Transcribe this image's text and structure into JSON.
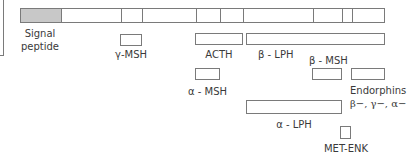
{
  "diagram": {
    "colors": {
      "line": "#7a7a7a",
      "signal_fill": "#c8c8c8",
      "text": "#3a3a3a"
    },
    "main_bar": {
      "segments": [
        {
          "name": "signal-peptide",
          "x0": 20,
          "x1": 60,
          "filled": true
        },
        {
          "name": "n-terminal",
          "x0": 60,
          "x1": 120
        },
        {
          "name": "gamma-msh",
          "x0": 120,
          "x1": 141
        },
        {
          "name": "joining",
          "x0": 141,
          "x1": 195
        },
        {
          "name": "alpha-msh",
          "x0": 195,
          "x1": 219
        },
        {
          "name": "clip",
          "x0": 219,
          "x1": 242
        },
        {
          "name": "gamma-lph-part",
          "x0": 242,
          "x1": 312
        },
        {
          "name": "beta-msh",
          "x0": 312,
          "x1": 341
        },
        {
          "name": "met-enk",
          "x0": 341,
          "x1": 351
        },
        {
          "name": "endorphin",
          "x0": 351,
          "x1": 384
        }
      ]
    },
    "labels": {
      "signal_line1": "Signal",
      "signal_line2": "peptide",
      "gamma_msh": "γ-MSH",
      "acth": "ACTH",
      "beta_lph": "β - LPH",
      "alpha_msh": "α - MSH",
      "beta_msh": "β - MSH",
      "endorphins": "Endorphins",
      "endorphins_types": "β−, γ−, α−",
      "alpha_lph": "α - LPH",
      "met_enk": "MET-ENK"
    }
  }
}
